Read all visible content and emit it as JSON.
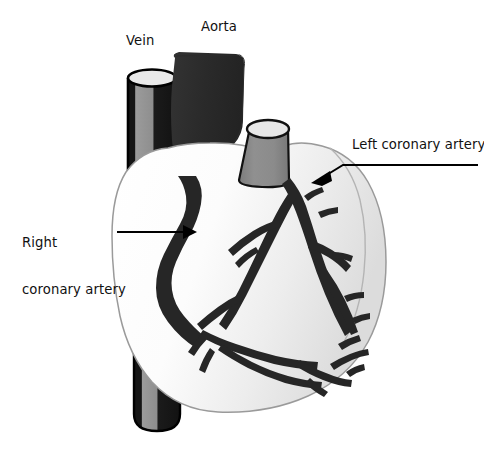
{
  "figure": {
    "type": "anatomical-illustration",
    "background_color": "#ffffff",
    "width": 484,
    "height": 454
  },
  "labels": {
    "vein": "Vein",
    "aorta": "Aorta",
    "left_coronary_artery": "Left coronary artery",
    "right_coronary_artery_line1": "Right",
    "right_coronary_artery_line2": "coronary artery"
  },
  "colors": {
    "text": "#111111",
    "artery_dark": "#262626",
    "aorta_dark": "#2b2b2b",
    "vein_gray": "#8c8c8c",
    "vein_dark": "#1c1c1c",
    "pulmonary_gray": "#8a8a8a",
    "lumen_light": "#e9e9e9",
    "heart_body_light": "#ffffff",
    "heart_body_shade": "#e2e2e2",
    "outline": "#9a9a9a",
    "leader_line": "#000000"
  },
  "structures": [
    {
      "name": "vein",
      "label": "Vein",
      "shape": "cylinder",
      "fill": "#8c8c8c"
    },
    {
      "name": "aorta",
      "label": "Aorta",
      "shape": "tube",
      "fill": "#2b2b2b"
    },
    {
      "name": "pulmonary-trunk",
      "label": "",
      "shape": "frustum",
      "fill": "#8a8a8a"
    },
    {
      "name": "heart-body",
      "label": "",
      "shape": "organ",
      "fill": "#ffffff"
    },
    {
      "name": "right-coronary-artery",
      "label": "Right coronary artery",
      "shape": "vessel",
      "fill": "#262626"
    },
    {
      "name": "left-coronary-artery",
      "label": "Left coronary artery",
      "shape": "vessel-tree",
      "fill": "#262626"
    }
  ],
  "annotations": [
    {
      "name": "right-coronary-arrow",
      "direction": "right",
      "target": "right-coronary-artery"
    },
    {
      "name": "left-coronary-arrow",
      "direction": "down-left",
      "target": "left-coronary-artery"
    }
  ]
}
